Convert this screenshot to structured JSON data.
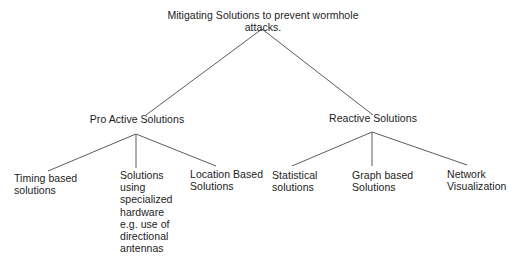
{
  "diagram": {
    "type": "tree",
    "title": "Mitigating Solutions to prevent wormhole attacks.",
    "root": {
      "label": "Mitigating Solutions to prevent wormhole attacks."
    },
    "branches": [
      {
        "label": "Pro Active Solutions"
      },
      {
        "label": "Reactive Solutions"
      }
    ],
    "leaves": [
      {
        "label": "Timing based\nsolutions"
      },
      {
        "label": "Solutions\nusing\nspecialized\nhardware\ne.g. use of\ndirectional\nantennas"
      },
      {
        "label": "Location Based\nSolutions"
      },
      {
        "label": "Statistical\nsolutions"
      },
      {
        "label": "Graph based\nSolutions"
      },
      {
        "label": "Network\nVisualization"
      }
    ],
    "colors": {
      "background": "#ffffff",
      "edge": "#5c5c5c",
      "text": "#1c1c1c"
    }
  }
}
